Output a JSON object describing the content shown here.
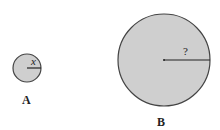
{
  "diagram": {
    "circles": [
      {
        "label": "A",
        "radius_label": "x",
        "cx": 27,
        "cy": 68,
        "r": 14
      },
      {
        "label": "B",
        "radius_label": "?",
        "cx": 164,
        "cy": 60,
        "r": 46
      }
    ],
    "fill_color": "#cfcfcf",
    "stroke_color": "#444444"
  }
}
